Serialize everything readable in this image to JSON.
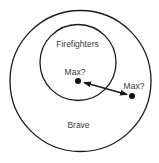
{
  "diagram": {
    "outer_set": {
      "label": "Brave",
      "cx": 80.5,
      "cy": 81,
      "r": 70.5
    },
    "inner_set": {
      "label": "Firefighters",
      "cx": 78,
      "cy": 62.5,
      "r": 38
    },
    "points": [
      {
        "label": "Max?",
        "x": 78,
        "y": 81,
        "label_x": 75,
        "label_y": 75
      },
      {
        "label": "Max?",
        "x": 132,
        "y": 96,
        "label_x": 134,
        "label_y": 89
      }
    ],
    "connector": {
      "type": "double-arrow",
      "x1": 84,
      "y1": 82.5,
      "x2": 127,
      "y2": 94.5
    },
    "colors": {
      "stroke": "#1a1a1a",
      "text": "#3a3a3a",
      "background": "#ffffff"
    }
  }
}
